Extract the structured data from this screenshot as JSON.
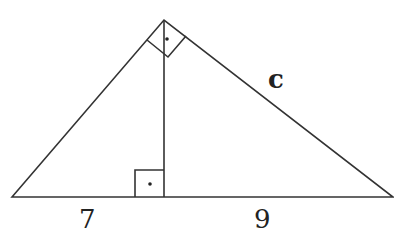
{
  "diagram": {
    "type": "right-triangle-with-altitude",
    "labels": {
      "hypotenuse_right_leg": "c",
      "left_segment": "7",
      "right_segment": "9"
    },
    "right_angle_markers": [
      "apex",
      "altitude-foot"
    ],
    "stroke_color": "#333333"
  }
}
